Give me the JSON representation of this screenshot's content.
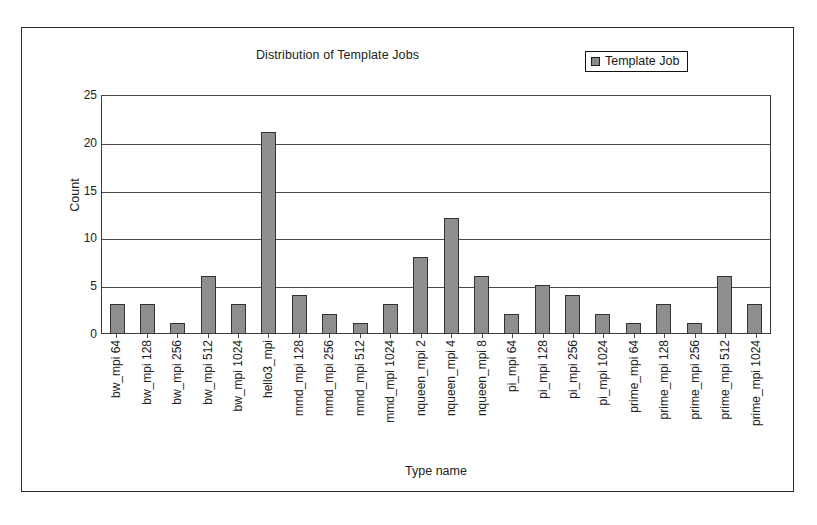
{
  "chart_data": {
    "type": "bar",
    "title": "Distribution of Template Jobs",
    "xlabel": "Type name",
    "ylabel": "Count",
    "ylim": [
      0,
      25
    ],
    "yticks": [
      25,
      20,
      15,
      10,
      5,
      0
    ],
    "grid": true,
    "legend_position": "top-right",
    "legend": [
      "Template Job"
    ],
    "series_color": "#8e8e8e",
    "categories": [
      "bw_mpi 64",
      "bw_mpi 128",
      "bw_mpi 256",
      "bw_mpi 512",
      "bw_mpi 1024",
      "hello3_mpi",
      "mmd_mpi 128",
      "mmd_mpi 256",
      "mmd_mpi 512",
      "mmd_mpi 1024",
      "nqueen_mpi 2",
      "nqueen_mpi 4",
      "nqueen_mpi 8",
      "pi_mpi 64",
      "pi_mpi 128",
      "pi_mpi 256",
      "pi_mpi 1024",
      "prime_mpi 64",
      "prime_mpi 128",
      "prime_mpi 256",
      "prime_mpi 512",
      "prime_mpi 1024"
    ],
    "series": [
      {
        "name": "Template Job",
        "values": [
          3,
          3,
          1,
          6,
          3,
          21,
          4,
          2,
          1,
          3,
          8,
          12,
          6,
          2,
          5,
          4,
          2,
          1,
          3,
          1,
          6,
          3
        ]
      }
    ]
  },
  "legend": {
    "label": "Template Job",
    "swatch_color": "#8e8e8e"
  },
  "axes": {
    "y_title": "Count",
    "x_title": "Type name"
  }
}
